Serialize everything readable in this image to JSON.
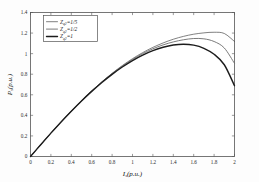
{
  "chart_data": {
    "type": "line",
    "title": "",
    "xlabel": "I_s (p.u.)",
    "xlabel_main": "I",
    "xlabel_sub": "s",
    "xlabel_unit": "(p.u.)",
    "ylabel": "P_s (p.u.)",
    "ylabel_main": "P",
    "ylabel_sub": "s",
    "ylabel_unit": "(p.u.)",
    "xlim": [
      0,
      2
    ],
    "ylim": [
      0,
      1.4
    ],
    "grid": false,
    "legend_position": "upper-left",
    "xticks": [
      "0",
      "0.2",
      "0.4",
      "0.6",
      "0.8",
      "1",
      "1.2",
      "1.4",
      "1.6",
      "1.8",
      "2"
    ],
    "xtick_values": [
      0,
      0.2,
      0.4,
      0.6,
      0.8,
      1,
      1.2,
      1.4,
      1.6,
      1.8,
      2
    ],
    "yticks": [
      "0",
      "0.2",
      "0.4",
      "0.6",
      "0.8",
      "1",
      "1.2",
      "1.4"
    ],
    "ytick_values": [
      0,
      0.2,
      0.4,
      0.6,
      0.8,
      1,
      1.2,
      1.4
    ],
    "x": [
      0,
      0.1,
      0.2,
      0.3,
      0.4,
      0.5,
      0.6,
      0.7,
      0.8,
      0.9,
      1.0,
      1.1,
      1.2,
      1.3,
      1.4,
      1.5,
      1.6,
      1.7,
      1.8,
      1.9,
      2.0
    ],
    "series": [
      {
        "name": "Z_q2 = 1/5",
        "label_main": "Z",
        "label_sub": "q2",
        "label_value": "=1/5",
        "color": "#4a4a4a",
        "style": "thin",
        "width": 0.7,
        "values": [
          0,
          0.115,
          0.228,
          0.337,
          0.442,
          0.543,
          0.638,
          0.727,
          0.809,
          0.884,
          0.951,
          1.01,
          1.061,
          1.104,
          1.14,
          1.168,
          1.189,
          1.202,
          1.208,
          1.196,
          1.118
        ]
      },
      {
        "name": "Z_q2 = 1/2",
        "label_main": "Z",
        "label_sub": "q2",
        "label_value": "=1/2",
        "color": "#6b6b6b",
        "style": "medium",
        "width": 0.9,
        "values": [
          0,
          0.115,
          0.228,
          0.337,
          0.442,
          0.543,
          0.637,
          0.725,
          0.806,
          0.879,
          0.944,
          1.0,
          1.047,
          1.085,
          1.114,
          1.135,
          1.147,
          1.144,
          1.118,
          1.055,
          0.905
        ]
      },
      {
        "name": "Z_q2 = 1",
        "label_main": "Z",
        "label_sub": "q2",
        "label_value": "=1",
        "color": "#1c1c1c",
        "style": "thick",
        "width": 1.4,
        "values": [
          0,
          0.115,
          0.227,
          0.336,
          0.44,
          0.54,
          0.633,
          0.72,
          0.799,
          0.87,
          0.933,
          0.986,
          1.029,
          1.062,
          1.084,
          1.092,
          1.083,
          1.052,
          0.994,
          0.892,
          0.688
        ]
      }
    ]
  },
  "legend": {
    "entries": [
      {
        "label_main": "Z",
        "label_sub": "q2",
        "label_value": "=1/5"
      },
      {
        "label_main": "Z",
        "label_sub": "q2",
        "label_value": "=1/2"
      },
      {
        "label_main": "Z",
        "label_sub": "q2",
        "label_value": "=1"
      }
    ]
  }
}
